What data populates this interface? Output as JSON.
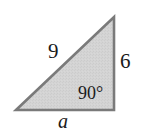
{
  "figure": {
    "type": "right-triangle-diagram",
    "background_color": "#ffffff",
    "fill_color": "#d2d2d2",
    "stroke_color": "#7a7a7a",
    "text_color": "#1a1a1a",
    "vertices": {
      "bottom_left": [
        16,
        110
      ],
      "bottom_right": [
        114,
        110
      ],
      "top_right": [
        114,
        17
      ]
    },
    "labels": {
      "hypotenuse": "9",
      "vertical_side": "6",
      "angle": "90°",
      "base": "a"
    }
  }
}
